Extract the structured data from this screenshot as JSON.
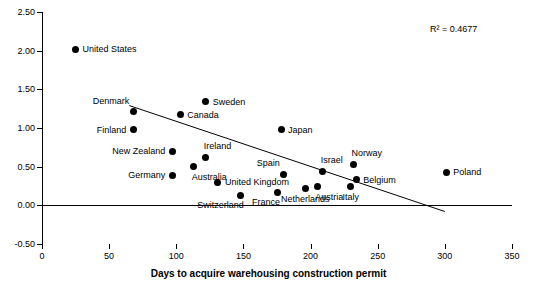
{
  "chart_data": {
    "type": "scatter",
    "title": "",
    "xlabel": "Days to acquire warehousing construction permit",
    "ylabel": "",
    "xlim": [
      0,
      350
    ],
    "ylim": [
      -0.5,
      2.5
    ],
    "xticks": [
      "0",
      "50",
      "100",
      "150",
      "200",
      "250",
      "300",
      "350"
    ],
    "yticks": [
      "-0.50",
      "0.00",
      "0.50",
      "1.00",
      "1.50",
      "2.00",
      "2.50"
    ],
    "grid": false,
    "legend": "none",
    "annotation": "R² = 0.4677",
    "trendline": {
      "x_start": 65,
      "y_start": 1.29,
      "x_end": 300,
      "y_end": -0.08
    },
    "points": [
      {
        "label": "United States",
        "x": 25,
        "y": 2.02,
        "label_pos": "right"
      },
      {
        "label": "Sweden",
        "x": 122,
        "y": 1.34,
        "label_pos": "right"
      },
      {
        "label": "Denmark",
        "x": 68,
        "y": 1.21,
        "label_pos": "above-left"
      },
      {
        "label": "Canada",
        "x": 103,
        "y": 1.17,
        "label_pos": "right"
      },
      {
        "label": "Finland",
        "x": 68,
        "y": 0.98,
        "label_pos": "left"
      },
      {
        "label": "Japan",
        "x": 178,
        "y": 0.98,
        "label_pos": "right"
      },
      {
        "label": "Ireland",
        "x": 122,
        "y": 0.62,
        "label_pos": "above-right"
      },
      {
        "label": "New Zealand",
        "x": 97,
        "y": 0.7,
        "label_pos": "left"
      },
      {
        "label": "Australia",
        "x": 113,
        "y": 0.5,
        "label_pos": "below-right"
      },
      {
        "label": "Norway",
        "x": 232,
        "y": 0.53,
        "label_pos": "above-right"
      },
      {
        "label": "Spain",
        "x": 180,
        "y": 0.4,
        "label_pos": "above-left"
      },
      {
        "label": "Israel",
        "x": 209,
        "y": 0.44,
        "label_pos": "above-right"
      },
      {
        "label": "Germany",
        "x": 97,
        "y": 0.39,
        "label_pos": "left"
      },
      {
        "label": "Poland",
        "x": 301,
        "y": 0.43,
        "label_pos": "right"
      },
      {
        "label": "Belgium",
        "x": 234,
        "y": 0.33,
        "label_pos": "right"
      },
      {
        "label": "United Kingdom",
        "x": 131,
        "y": 0.3,
        "label_pos": "right"
      },
      {
        "label": "Austria",
        "x": 205,
        "y": 0.24,
        "label_pos": "below-right"
      },
      {
        "label": "Netherlands",
        "x": 196,
        "y": 0.22,
        "label_pos": "below"
      },
      {
        "label": "Italy",
        "x": 230,
        "y": 0.25,
        "label_pos": "below"
      },
      {
        "label": "France",
        "x": 175,
        "y": 0.17,
        "label_pos": "below-left"
      },
      {
        "label": "Switzerland",
        "x": 148,
        "y": 0.13,
        "label_pos": "below-left"
      }
    ]
  }
}
